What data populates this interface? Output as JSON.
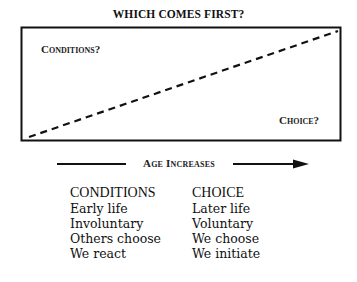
{
  "title": "WHICH COMES FIRST?",
  "box": {
    "top_left_label": "Conditions?",
    "bottom_right_label": "Choice?",
    "diagonal": "dashed line rising from bottom-left to top-right"
  },
  "axis": {
    "label": "Age Increases",
    "direction": "right"
  },
  "columns": {
    "left": {
      "heading": "CONDITIONS",
      "items": [
        "Early life",
        "Involuntary",
        "Others choose",
        "We react"
      ]
    },
    "right": {
      "heading": "CHOICE",
      "items": [
        "Later life",
        "Voluntary",
        "We choose",
        "We initiate"
      ]
    }
  },
  "colors": {
    "ink": "#111111",
    "background": "#ffffff"
  }
}
